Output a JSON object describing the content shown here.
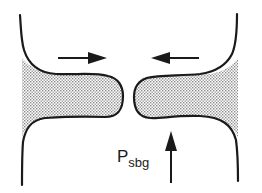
{
  "diagram": {
    "type": "schematic",
    "colors": {
      "stroke": "#1a1a1a",
      "shade": "#b8b8b8",
      "background": "#ffffff"
    },
    "arrows": [
      {
        "id": "left-arrow",
        "direction": "right"
      },
      {
        "id": "right-arrow",
        "direction": "left"
      },
      {
        "id": "up-arrow",
        "direction": "up"
      }
    ],
    "label": {
      "main": "P",
      "subscript": "sbg"
    }
  }
}
